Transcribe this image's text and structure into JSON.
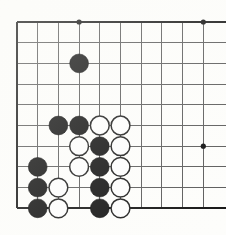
{
  "app": {
    "title": "Go Board Diagram",
    "type": "go-board-position"
  },
  "board": {
    "label": "Go board corner diagram",
    "columns_visible": 10,
    "rows_visible": 10,
    "cell_size": 20.7,
    "origin_x": 17,
    "origin_y": 22,
    "line_color": "#5a5a5a",
    "border_color": "#141414",
    "background_color": "#fdfdfb",
    "black_color": "#111111",
    "white_color": "#fdfdfd",
    "stone_radius": 9.4,
    "clipped_edges": [
      "right"
    ],
    "closed_edges": [
      "left",
      "top",
      "bottom"
    ]
  },
  "star_points": [
    {
      "col": 3,
      "row": 0
    },
    {
      "col": 9,
      "row": 0
    },
    {
      "col": 9,
      "row": 6
    }
  ],
  "stones": [
    {
      "color": "black",
      "col": 3,
      "row": 2
    },
    {
      "color": "black",
      "col": 2,
      "row": 5
    },
    {
      "color": "black",
      "col": 3,
      "row": 5
    },
    {
      "color": "white",
      "col": 4,
      "row": 5
    },
    {
      "color": "white",
      "col": 5,
      "row": 5
    },
    {
      "color": "white",
      "col": 3,
      "row": 6
    },
    {
      "color": "black",
      "col": 4,
      "row": 6
    },
    {
      "color": "white",
      "col": 5,
      "row": 6
    },
    {
      "color": "black",
      "col": 1,
      "row": 7
    },
    {
      "color": "white",
      "col": 3,
      "row": 7
    },
    {
      "color": "black",
      "col": 4,
      "row": 7
    },
    {
      "color": "white",
      "col": 5,
      "row": 7
    },
    {
      "color": "black",
      "col": 1,
      "row": 8
    },
    {
      "color": "white",
      "col": 2,
      "row": 8
    },
    {
      "color": "black",
      "col": 4,
      "row": 8
    },
    {
      "color": "white",
      "col": 5,
      "row": 8
    },
    {
      "color": "black",
      "col": 1,
      "row": 9
    },
    {
      "color": "white",
      "col": 2,
      "row": 9
    },
    {
      "color": "black",
      "col": 4,
      "row": 9
    },
    {
      "color": "white",
      "col": 5,
      "row": 9
    }
  ]
}
